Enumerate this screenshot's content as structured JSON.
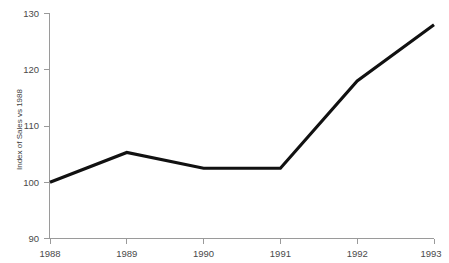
{
  "chart_data": {
    "type": "line",
    "title": "",
    "subtitle": "",
    "xlabel": "",
    "ylabel": "Index of Sales vs 1988",
    "categories": [
      "1988",
      "1989",
      "1990",
      "1991",
      "1992",
      "1993"
    ],
    "x": [
      1988,
      1989,
      1990,
      1991,
      1992,
      1993
    ],
    "values": [
      100,
      105.3,
      102.5,
      102.5,
      118,
      128
    ],
    "series": [
      {
        "name": "Index of Sales vs 1988",
        "values": [
          100,
          105.3,
          102.5,
          102.5,
          118,
          128
        ],
        "color": "#111111"
      }
    ],
    "ylim": [
      90,
      130
    ],
    "yticks": [
      90,
      100,
      110,
      120,
      130
    ],
    "ytick_labels": [
      "90",
      "100",
      "110",
      "120",
      "130"
    ],
    "xticks": [
      1988,
      1989,
      1990,
      1991,
      1992,
      1993
    ],
    "xtick_labels": [
      "1988",
      "1989",
      "1990",
      "1991",
      "1992",
      "1993"
    ],
    "grid": false,
    "legend": false,
    "legend_position": "none",
    "line_color": "#111111",
    "axis_color": "#9a9a9a",
    "background_color": "#ffffff"
  },
  "axis": {
    "y_title": "Index of Sales vs 1988",
    "y_labels": {
      "t0": "90",
      "t1": "100",
      "t2": "110",
      "t3": "120",
      "t4": "130"
    },
    "x_labels": {
      "t0": "1988",
      "t1": "1989",
      "t2": "1990",
      "t3": "1991",
      "t4": "1992",
      "t5": "1993"
    }
  }
}
